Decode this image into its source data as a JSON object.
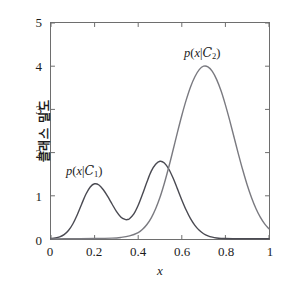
{
  "chart_data": {
    "type": "line",
    "title": "",
    "xlabel": "x",
    "ylabel": "클래스 밀도",
    "xlim": [
      0,
      1
    ],
    "ylim": [
      0,
      5
    ],
    "xticks": [
      "0",
      "0.2",
      "0.4",
      "0.6",
      "0.8",
      "1"
    ],
    "xtick_values": [
      0,
      0.2,
      0.4,
      0.6,
      0.8,
      1
    ],
    "yticks": [
      "0",
      "1",
      "2",
      "3",
      "4",
      "5"
    ],
    "ytick_values": [
      0,
      1,
      2,
      3,
      4,
      5
    ],
    "grid": false,
    "legend_position": "inline-annotation",
    "series": [
      {
        "name": "p(x|C_1)",
        "label_text": "p(x|C1)",
        "color": "#4a4a52",
        "linewidth": 1.4,
        "annotation": {
          "x": 0.17,
          "y": 2.25
        },
        "description": "bimodal class-conditional density with peaks near x=0.2 (height 1.28) and x=0.5 (height 1.8)",
        "points": [
          [
            0.0,
            0.01
          ],
          [
            0.02,
            0.022
          ],
          [
            0.04,
            0.048
          ],
          [
            0.06,
            0.1
          ],
          [
            0.08,
            0.196
          ],
          [
            0.1,
            0.348
          ],
          [
            0.12,
            0.556
          ],
          [
            0.14,
            0.8
          ],
          [
            0.16,
            1.035
          ],
          [
            0.18,
            1.205
          ],
          [
            0.2,
            1.278
          ],
          [
            0.22,
            1.25
          ],
          [
            0.24,
            1.14
          ],
          [
            0.26,
            0.985
          ],
          [
            0.28,
            0.81
          ],
          [
            0.3,
            0.64
          ],
          [
            0.32,
            0.51
          ],
          [
            0.34,
            0.452
          ],
          [
            0.35,
            0.45
          ],
          [
            0.36,
            0.47
          ],
          [
            0.38,
            0.58
          ],
          [
            0.4,
            0.78
          ],
          [
            0.42,
            1.04
          ],
          [
            0.44,
            1.32
          ],
          [
            0.46,
            1.57
          ],
          [
            0.48,
            1.73
          ],
          [
            0.5,
            1.8
          ],
          [
            0.52,
            1.76
          ],
          [
            0.54,
            1.62
          ],
          [
            0.56,
            1.41
          ],
          [
            0.58,
            1.16
          ],
          [
            0.6,
            0.905
          ],
          [
            0.62,
            0.67
          ],
          [
            0.64,
            0.47
          ],
          [
            0.66,
            0.315
          ],
          [
            0.68,
            0.2
          ],
          [
            0.7,
            0.122
          ],
          [
            0.72,
            0.072
          ],
          [
            0.74,
            0.042
          ],
          [
            0.76,
            0.024
          ],
          [
            0.78,
            0.014
          ],
          [
            0.8,
            0.01
          ],
          [
            0.85,
            0.006
          ],
          [
            0.9,
            0.005
          ],
          [
            0.95,
            0.005
          ],
          [
            1.0,
            0.005
          ]
        ]
      },
      {
        "name": "p(x|C_2)",
        "label_text": "p(x|C2)",
        "color": "#7a7a80",
        "linewidth": 1.4,
        "annotation": {
          "x": 0.615,
          "y": 4.55
        },
        "description": "unimodal class-conditional density peaking at x=0.7 with height 4.0",
        "points": [
          [
            0.0,
            0.004
          ],
          [
            0.1,
            0.006
          ],
          [
            0.2,
            0.01
          ],
          [
            0.28,
            0.02
          ],
          [
            0.32,
            0.036
          ],
          [
            0.36,
            0.072
          ],
          [
            0.4,
            0.15
          ],
          [
            0.42,
            0.225
          ],
          [
            0.44,
            0.335
          ],
          [
            0.46,
            0.49
          ],
          [
            0.48,
            0.7
          ],
          [
            0.5,
            0.965
          ],
          [
            0.52,
            1.29
          ],
          [
            0.54,
            1.66
          ],
          [
            0.56,
            2.06
          ],
          [
            0.58,
            2.47
          ],
          [
            0.6,
            2.86
          ],
          [
            0.62,
            3.215
          ],
          [
            0.64,
            3.52
          ],
          [
            0.66,
            3.755
          ],
          [
            0.68,
            3.92
          ],
          [
            0.7,
            4.0
          ],
          [
            0.72,
            3.985
          ],
          [
            0.74,
            3.88
          ],
          [
            0.76,
            3.69
          ],
          [
            0.78,
            3.43
          ],
          [
            0.8,
            3.105
          ],
          [
            0.82,
            2.74
          ],
          [
            0.84,
            2.35
          ],
          [
            0.86,
            1.96
          ],
          [
            0.88,
            1.59
          ],
          [
            0.9,
            1.25
          ],
          [
            0.92,
            0.955
          ],
          [
            0.94,
            0.705
          ],
          [
            0.96,
            0.505
          ],
          [
            0.98,
            0.35
          ],
          [
            1.0,
            0.235
          ]
        ]
      }
    ]
  },
  "axes": {
    "frame_color": "#6e6e6e",
    "tick_color": "#6e6e6e",
    "background": "#ffffff"
  }
}
